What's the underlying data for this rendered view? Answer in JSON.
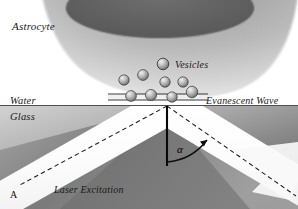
{
  "figure": {
    "panel_label": "A",
    "labels": {
      "astrocyte": "Astrocyte",
      "vesicles": "Vesicles",
      "water": "Water",
      "glass": "Glass",
      "evanescent_wave": "Evanescent Wave",
      "laser_excitation": "Laser Excitation",
      "angle": "α"
    },
    "colors": {
      "background": "#ffffff",
      "cell_light": "#e9e9e9",
      "cell_mid": "#9a9a9a",
      "cell_dark": "#707070",
      "nucleus": "#5d5d5d",
      "glass_light": "#c9c9c9",
      "glass_dark": "#5a5a5a",
      "beam": "#fdfdfd",
      "line": "#1a1a1a",
      "vesicle_light": "#e2e2e2",
      "vesicle_dark": "#6a6a6a"
    },
    "geometry": {
      "interface_y": 106,
      "normal_x": 167,
      "normal_top_y": 106,
      "normal_bottom_y": 166,
      "incident_angle_deg": 62,
      "membrane_y": 97
    },
    "free_vesicles": [
      {
        "cx": 124,
        "cy": 80,
        "r": 5.2
      },
      {
        "cx": 143,
        "cy": 75,
        "r": 5.4
      },
      {
        "cx": 163,
        "cy": 64,
        "r": 5.8
      },
      {
        "cx": 165,
        "cy": 82,
        "r": 5.2
      },
      {
        "cx": 183,
        "cy": 82,
        "r": 5.2
      }
    ],
    "docked_vesicles": [
      {
        "cx": 131,
        "cy": 96,
        "r": 5.4
      },
      {
        "cx": 151,
        "cy": 95,
        "r": 5.6
      },
      {
        "cx": 172,
        "cy": 97,
        "r": 5.2
      },
      {
        "cx": 192,
        "cy": 92,
        "r": 5.8
      }
    ]
  }
}
